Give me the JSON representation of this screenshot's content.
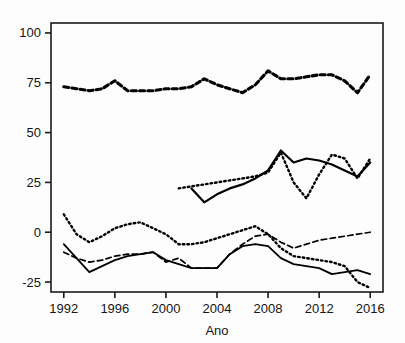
{
  "chart_data": {
    "type": "line",
    "title": "",
    "xlabel": "Ano",
    "ylabel": "",
    "xlim": [
      1991,
      2017
    ],
    "ylim": [
      -30,
      105
    ],
    "grid": false,
    "legend": "none",
    "x_ticks": [
      "1992",
      "1996",
      "2000",
      "2004",
      "2008",
      "2012",
      "2016"
    ],
    "x_tick_values": [
      1992,
      1996,
      2000,
      2004,
      2008,
      2012,
      2016
    ],
    "y_ticks": [
      "100",
      "75",
      "50",
      "25",
      "0",
      "-25"
    ],
    "y_tick_values": [
      100,
      75,
      50,
      25,
      0,
      -25
    ],
    "series": [
      {
        "name": "serie-1-heavy-dashed-top",
        "style": "heavy-dashed",
        "x": [
          1992,
          1993,
          1994,
          1995,
          1996,
          1997,
          1998,
          1999,
          2000,
          2001,
          2002,
          2003,
          2004,
          2005,
          2006,
          2007,
          2008,
          2009,
          2010,
          2011,
          2012,
          2013,
          2014,
          2015,
          2016
        ],
        "values": [
          73,
          72,
          71,
          72,
          76,
          71,
          71,
          71,
          72,
          72,
          73,
          77,
          74,
          72,
          70,
          74,
          81,
          77,
          77,
          78,
          79,
          79,
          76,
          70,
          79
        ]
      },
      {
        "name": "serie-2-solid-middle",
        "style": "solid",
        "x": [
          2002,
          2003,
          2004,
          2005,
          2006,
          2007,
          2008,
          2009,
          2010,
          2011,
          2012,
          2013,
          2014,
          2015,
          2016
        ],
        "values": [
          22,
          15,
          19,
          22,
          24,
          27,
          31,
          41,
          35,
          37,
          36,
          34,
          31,
          28,
          35
        ]
      },
      {
        "name": "serie-3-dotted-middle",
        "style": "dotted",
        "x": [
          2001,
          2002,
          2003,
          2004,
          2005,
          2006,
          2007,
          2008,
          2009,
          2010,
          2011,
          2012,
          2013,
          2014,
          2015,
          2016
        ],
        "values": [
          22,
          23,
          24,
          25,
          26,
          27,
          28,
          30,
          40,
          25,
          17,
          29,
          39,
          37,
          27,
          37
        ]
      },
      {
        "name": "serie-4-dotted-lower",
        "style": "dotted",
        "x": [
          1992,
          1993,
          1994,
          1995,
          1996,
          1997,
          1998,
          1999,
          2000,
          2001,
          2002,
          2003,
          2004,
          2005,
          2006,
          2007,
          2008,
          2009,
          2010,
          2011,
          2012,
          2013,
          2014,
          2015,
          2016
        ],
        "values": [
          9,
          -1,
          -5,
          -2,
          2,
          4,
          5,
          2,
          -1,
          -6,
          -6,
          -5,
          -3,
          -1,
          1,
          3,
          -1,
          -8,
          -12,
          -13,
          -14,
          -15,
          -17,
          -25,
          -28
        ]
      },
      {
        "name": "serie-5-dashed-lower",
        "style": "dashed",
        "x": [
          1992,
          1993,
          1994,
          1995,
          1996,
          1997,
          1998,
          1999,
          2000,
          2001,
          2002,
          2003,
          2004,
          2005,
          2006,
          2007,
          2008,
          2009,
          2010,
          2011,
          2012,
          2013,
          2014,
          2015,
          2016
        ],
        "values": [
          -10,
          -13,
          -15,
          -14,
          -12,
          -11,
          -11,
          -10,
          -15,
          -13,
          -18,
          -18,
          -18,
          -11,
          -6,
          -2,
          -1,
          -5,
          -8,
          -6,
          -4,
          -3,
          -2,
          -1,
          0
        ]
      },
      {
        "name": "serie-6-solid-lower",
        "style": "solid-thin",
        "x": [
          1992,
          1993,
          1994,
          1995,
          1996,
          1997,
          1998,
          1999,
          2000,
          2001,
          2002,
          2003,
          2004,
          2005,
          2006,
          2007,
          2008,
          2009,
          2010,
          2011,
          2012,
          2013,
          2014,
          2015,
          2016
        ],
        "values": [
          -6,
          -13,
          -20,
          -17,
          -14,
          -12,
          -11,
          -10,
          -14,
          -16,
          -18,
          -18,
          -18,
          -11,
          -7,
          -6,
          -7,
          -13,
          -16,
          -17,
          -18,
          -21,
          -20,
          -19,
          -21
        ]
      }
    ]
  },
  "colors": {
    "ink": "#000000",
    "axis": "#1a1a1a",
    "background": "#fdfdfd"
  }
}
